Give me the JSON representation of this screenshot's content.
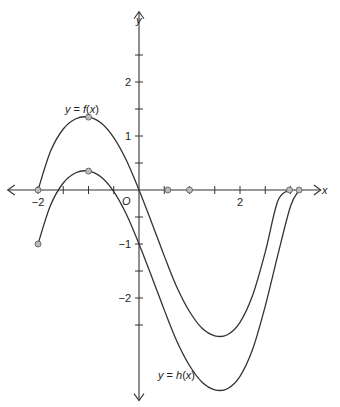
{
  "chart_data": {
    "type": "line",
    "title": "",
    "xlabel": "x",
    "ylabel": "y",
    "origin_label": "O",
    "xlim": [
      -2.6,
      3.6
    ],
    "ylim": [
      -3.9,
      3.3
    ],
    "x_ticks": [
      -2,
      -1.5,
      -1,
      -0.5,
      0.5,
      1,
      1.5,
      2,
      2.5,
      3
    ],
    "x_tick_labels": [
      {
        "value": -2,
        "text": "−2"
      },
      {
        "value": 2,
        "text": "2"
      }
    ],
    "y_ticks": [
      -2.5,
      -2,
      -1.5,
      -1,
      -0.5,
      0.5,
      1,
      1.5,
      2,
      2.5
    ],
    "y_tick_labels": [
      {
        "value": 2,
        "text": "2"
      },
      {
        "value": 1,
        "text": "1"
      },
      {
        "value": -1,
        "text": "−1"
      },
      {
        "value": -2,
        "text": "−2"
      }
    ],
    "grid": false,
    "series": [
      {
        "name": "y = f(x)",
        "label_parts": [
          "y",
          " = ",
          "f",
          "(",
          "x",
          ")"
        ],
        "points": [
          [
            -2,
            0
          ],
          [
            -1.75,
            0.72
          ],
          [
            -1.5,
            1.13
          ],
          [
            -1.25,
            1.32
          ],
          [
            -1,
            1.35
          ],
          [
            -0.75,
            1.24
          ],
          [
            -0.5,
            0.97
          ],
          [
            -0.25,
            0.55
          ],
          [
            0,
            0
          ],
          [
            0.25,
            -0.6
          ],
          [
            0.5,
            -1.22
          ],
          [
            0.75,
            -1.8
          ],
          [
            1,
            -2.25
          ],
          [
            1.25,
            -2.56
          ],
          [
            1.5,
            -2.7
          ],
          [
            1.75,
            -2.68
          ],
          [
            2,
            -2.45
          ],
          [
            2.25,
            -1.95
          ],
          [
            2.5,
            -1.15
          ],
          [
            2.75,
            -0.2
          ],
          [
            2.98,
            0
          ]
        ],
        "markers": [
          [
            -2,
            0
          ],
          [
            -1,
            1.35
          ],
          [
            2.98,
            0
          ]
        ]
      },
      {
        "name": "y = h(x)",
        "label_parts": [
          "y",
          " = ",
          "h",
          "(",
          "x",
          ")"
        ],
        "points": [
          [
            -2,
            -1
          ],
          [
            -1.75,
            -0.28
          ],
          [
            -1.5,
            0.13
          ],
          [
            -1.25,
            0.32
          ],
          [
            -1,
            0.35
          ],
          [
            -0.75,
            0.24
          ],
          [
            -0.5,
            -0.03
          ],
          [
            -0.25,
            -0.45
          ],
          [
            0,
            -1
          ],
          [
            0.25,
            -1.6
          ],
          [
            0.5,
            -2.22
          ],
          [
            0.75,
            -2.8
          ],
          [
            1,
            -3.25
          ],
          [
            1.25,
            -3.56
          ],
          [
            1.5,
            -3.7
          ],
          [
            1.75,
            -3.68
          ],
          [
            2,
            -3.45
          ],
          [
            2.25,
            -2.95
          ],
          [
            2.5,
            -2.15
          ],
          [
            2.75,
            -1.2
          ],
          [
            3.0,
            -0.3
          ],
          [
            3.17,
            0
          ]
        ],
        "markers": [
          [
            -2,
            -1
          ],
          [
            -1,
            0.35
          ],
          [
            3.17,
            0
          ]
        ]
      }
    ],
    "x_axis_markers": [
      0.57,
      1.0
    ]
  }
}
